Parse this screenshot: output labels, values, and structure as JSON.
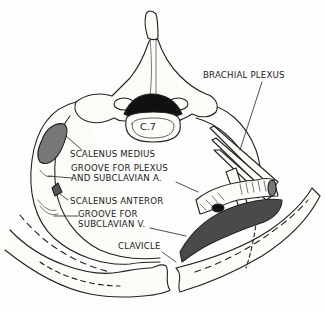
{
  "figure": {
    "vertebra_label": "C.7",
    "labels": {
      "brachial_plexus": "BRACHIAL PLEXUS",
      "scalenus_medius": "SCALENUS MEDIUS",
      "groove_plexus_line1": "GROOVE FOR PLEXUS",
      "groove_plexus_line2": "AND SUBCLAVIAN A.",
      "scalenus_anterior": "SCALENUS ANTEROR",
      "groove_vein_line1": "GROOVE FOR",
      "groove_vein_line2": "SUBCLAVIAN V.",
      "clavicle": "CLAVICLE"
    },
    "colors": {
      "ink": "#222222",
      "bone_fill": "#fbfbf8",
      "vein_fill": "#4a4a4a",
      "canal_fill": "#111111"
    }
  }
}
